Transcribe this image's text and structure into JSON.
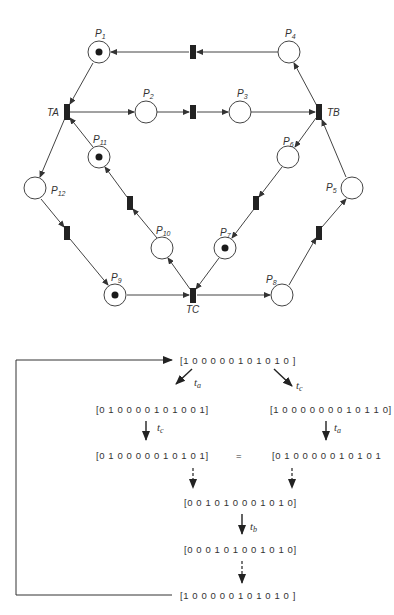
{
  "petri_net": {
    "places": [
      {
        "id": "P1",
        "label": "P",
        "sub": "1",
        "token": true
      },
      {
        "id": "P2",
        "label": "P",
        "sub": "2",
        "token": false
      },
      {
        "id": "P3",
        "label": "P",
        "sub": "3",
        "token": false
      },
      {
        "id": "P4",
        "label": "P",
        "sub": "4",
        "token": false
      },
      {
        "id": "P5",
        "label": "P",
        "sub": "5",
        "token": false
      },
      {
        "id": "P6",
        "label": "P",
        "sub": "6",
        "token": false
      },
      {
        "id": "P7",
        "label": "P",
        "sub": "7",
        "token": true
      },
      {
        "id": "P8",
        "label": "P",
        "sub": "8",
        "token": false
      },
      {
        "id": "P9",
        "label": "P",
        "sub": "9",
        "token": true
      },
      {
        "id": "P10",
        "label": "P",
        "sub": "10",
        "token": false
      },
      {
        "id": "P11",
        "label": "P",
        "sub": "11",
        "token": true
      },
      {
        "id": "P12",
        "label": "P",
        "sub": "12",
        "token": false
      }
    ],
    "transitions": {
      "ta": "TA",
      "tb": "TB",
      "tc": "TC"
    }
  },
  "reachability": {
    "m0": "[1 0  0 0 0 0 1 0 1 0 1 0 ]",
    "left_1": "[0 1 0 0 0 0 1 0 1 0 0 1]",
    "right_1": "[1 0 0 0 0 0 0 0 1 0 1 1 0]",
    "left_2": "[0 1 0 0 0 0 0 1 0 1 0 1]",
    "equals": "=",
    "right_2": "[0 1 0 0 0 0 0 1 0 1 0 1",
    "mid_1": "[0 0 1 0 1 0 0 0 1 0 1 0]",
    "mid_2": "[0 0 0 1 0 1 0 0 1 0 1 0]",
    "m_end": "[1 0  0 0 0 0 1 0 1 0 1 0 ]",
    "labels": {
      "ta_left": {
        "t": "t",
        "s": "a"
      },
      "tc_right": {
        "t": "t",
        "s": "c"
      },
      "tc_left": {
        "t": "t",
        "s": "c"
      },
      "ta_right": {
        "t": "t",
        "s": "a"
      },
      "tb_mid": {
        "t": "t",
        "s": "b"
      }
    }
  }
}
